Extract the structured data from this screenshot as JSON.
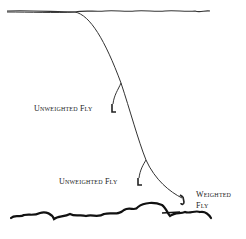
{
  "diagram": {
    "labels": {
      "fly1": "Unweighted Fly",
      "fly2": "Unweighted Fly",
      "fly3_line1": "Weighted",
      "fly3_line2": "Fly"
    },
    "elements": {
      "surface": "water-surface",
      "bottom": "stream-bottom",
      "line": "leader-line"
    },
    "colors": {
      "line": "#333333",
      "background": "#ffffff"
    }
  }
}
